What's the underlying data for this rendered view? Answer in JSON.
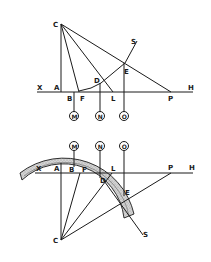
{
  "figure": {
    "top": {
      "labels": {
        "C": "C",
        "S": "S",
        "E": "E",
        "D": "D",
        "X": "X",
        "A": "A",
        "H": "H",
        "B": "B",
        "F": "F",
        "L": "L",
        "P": "P"
      },
      "circles": {
        "M": "M",
        "N": "N",
        "O": "O"
      }
    },
    "bottom": {
      "labels": {
        "X": "X",
        "A": "A",
        "B": "B",
        "F": "F",
        "L": "L",
        "P": "P",
        "H": "H",
        "D": "D",
        "E": "E",
        "C": "C",
        "S": "S"
      },
      "circles": {
        "M": "M",
        "N": "N",
        "O": "O"
      }
    },
    "colors": {
      "ink": "#1a1a1a",
      "band": "#c8c8c8",
      "background": "#ffffff"
    }
  }
}
